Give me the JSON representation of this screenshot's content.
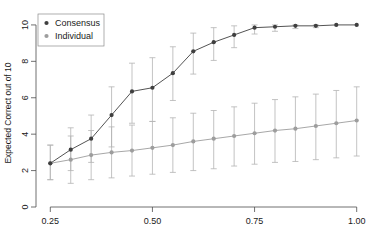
{
  "chart_data": {
    "type": "line",
    "title": "",
    "subtitle": "",
    "xlabel": "",
    "ylabel": "Expected Correct out of 10",
    "xlim": [
      0.215,
      1.035
    ],
    "ylim": [
      0,
      10.6
    ],
    "grid": false,
    "legend_position": "top-left",
    "xticks": [
      0.25,
      0.5,
      0.75,
      1.0
    ],
    "xtick_labels": [
      "0.25",
      "0.50",
      "0.75",
      "1.00"
    ],
    "yticks": [
      0,
      2,
      4,
      6,
      8,
      10
    ],
    "ytick_labels": [
      "0",
      "2",
      "4",
      "6",
      "8",
      "10"
    ],
    "x": [
      0.25,
      0.3,
      0.35,
      0.4,
      0.45,
      0.5,
      0.55,
      0.6,
      0.65,
      0.7,
      0.75,
      0.8,
      0.85,
      0.9,
      0.95,
      1.0
    ],
    "series": [
      {
        "name": "Consensus",
        "color": "#3f3f3f",
        "marker": "circle",
        "values": [
          2.4,
          3.15,
          3.75,
          5.05,
          6.35,
          6.55,
          7.35,
          8.55,
          9.05,
          9.45,
          9.85,
          9.9,
          9.95,
          9.95,
          10.0,
          10.0
        ],
        "err_low": [
          1.5,
          2.0,
          2.45,
          3.3,
          4.6,
          4.7,
          5.85,
          7.3,
          8.05,
          8.75,
          9.5,
          9.65,
          9.8,
          9.85,
          10.0,
          10.0
        ],
        "err_high": [
          3.4,
          4.35,
          5.05,
          6.6,
          7.9,
          8.2,
          8.8,
          9.55,
          9.85,
          9.95,
          10.0,
          10.0,
          10.0,
          10.0,
          10.0,
          10.0
        ]
      },
      {
        "name": "Individual",
        "color": "#9d9d9d",
        "marker": "circle",
        "values": [
          2.4,
          2.6,
          2.85,
          3.0,
          3.1,
          3.25,
          3.4,
          3.6,
          3.75,
          3.9,
          4.05,
          4.2,
          4.3,
          4.45,
          4.6,
          4.75
        ],
        "err_low": [
          1.5,
          1.3,
          1.5,
          1.6,
          1.7,
          1.8,
          1.9,
          2.0,
          2.1,
          2.25,
          2.35,
          2.45,
          2.5,
          2.6,
          2.7,
          2.8
        ],
        "err_high": [
          3.4,
          3.9,
          4.2,
          4.4,
          4.5,
          4.7,
          4.9,
          5.15,
          5.3,
          5.5,
          5.7,
          5.9,
          6.05,
          6.2,
          6.4,
          6.6
        ]
      }
    ],
    "legend": [
      {
        "label": "Consensus",
        "color": "#3f3f3f"
      },
      {
        "label": "Individual",
        "color": "#9d9d9d"
      }
    ]
  }
}
